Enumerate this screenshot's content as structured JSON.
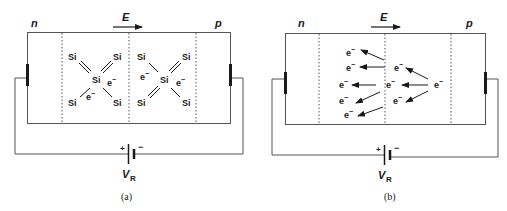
{
  "panels": [
    {
      "id": "a",
      "caption": "(a)",
      "n_label": "n",
      "p_label": "p",
      "field_label": "E",
      "battery_plus": "+",
      "battery_minus": "−",
      "battery_label": "V",
      "battery_sub": "R",
      "atoms": [
        {
          "t": "Si",
          "x": 73,
          "y": 62
        },
        {
          "t": "Si",
          "x": 117,
          "y": 62
        },
        {
          "t": "Si",
          "x": 96,
          "y": 82
        },
        {
          "t": "Si",
          "x": 73,
          "y": 104
        },
        {
          "t": "Si",
          "x": 117,
          "y": 104
        },
        {
          "t": "Si",
          "x": 142,
          "y": 62
        },
        {
          "t": "Si",
          "x": 186,
          "y": 62
        },
        {
          "t": "Si",
          "x": 163,
          "y": 82
        },
        {
          "t": "Si",
          "x": 142,
          "y": 104
        },
        {
          "t": "Si",
          "x": 186,
          "y": 104
        }
      ],
      "electrons": [
        {
          "x": 112,
          "y": 85
        },
        {
          "x": 88,
          "y": 98
        },
        {
          "x": 142,
          "y": 80
        },
        {
          "x": 180,
          "y": 85
        }
      ]
    },
    {
      "id": "b",
      "caption": "(b)",
      "n_label": "n",
      "p_label": "p",
      "field_label": "E",
      "battery_plus": "+",
      "battery_minus": "−",
      "battery_label": "V",
      "battery_sub": "R",
      "electrons": [
        {
          "x": 349,
          "y": 53
        },
        {
          "x": 349,
          "y": 68
        },
        {
          "x": 342,
          "y": 85
        },
        {
          "x": 342,
          "y": 101
        },
        {
          "x": 347,
          "y": 115
        },
        {
          "x": 397,
          "y": 68
        },
        {
          "x": 389,
          "y": 85
        },
        {
          "x": 396,
          "y": 101
        },
        {
          "x": 437,
          "y": 85
        }
      ],
      "arrows": [
        {
          "x1": 384,
          "y1": 60,
          "x2": 360,
          "y2": 49
        },
        {
          "x1": 385,
          "y1": 67,
          "x2": 360,
          "y2": 67
        },
        {
          "x1": 375,
          "y1": 84,
          "x2": 353,
          "y2": 84
        },
        {
          "x1": 380,
          "y1": 91,
          "x2": 356,
          "y2": 103
        },
        {
          "x1": 383,
          "y1": 106,
          "x2": 358,
          "y2": 115
        },
        {
          "x1": 427,
          "y1": 79,
          "x2": 406,
          "y2": 68
        },
        {
          "x1": 427,
          "y1": 84,
          "x2": 402,
          "y2": 84
        },
        {
          "x1": 428,
          "y1": 90,
          "x2": 406,
          "y2": 101
        }
      ]
    }
  ]
}
